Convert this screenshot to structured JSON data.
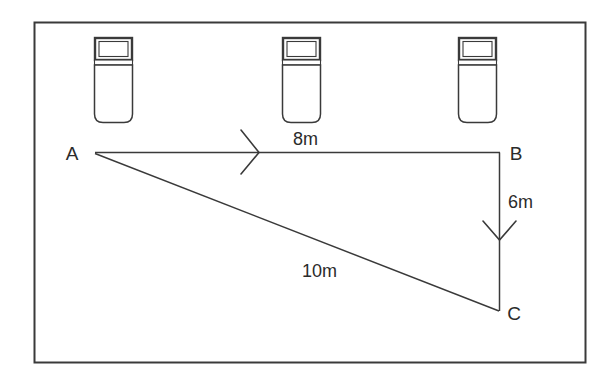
{
  "figure": {
    "background_color": "#ffffff",
    "stroke_color": "#2b2b2b",
    "border": {
      "name": "outer-frame",
      "x": 34,
      "y": 22,
      "width": 551,
      "height": 340
    }
  },
  "cars": [
    {
      "name": "car-left",
      "x": 94,
      "y": 37,
      "width": 39,
      "height": 86
    },
    {
      "name": "car-middle",
      "x": 282,
      "y": 37,
      "width": 39,
      "height": 86
    },
    {
      "name": "car-right",
      "x": 458,
      "y": 37,
      "width": 39,
      "height": 86
    }
  ],
  "points": [
    {
      "id": "A",
      "label": "A",
      "x": 95,
      "y": 153,
      "label_x": 72,
      "label_y": 159
    },
    {
      "id": "B",
      "label": "B",
      "x": 500,
      "y": 152,
      "label_x": 512,
      "label_y": 159
    },
    {
      "id": "C",
      "label": "C",
      "x": 498,
      "y": 310,
      "label_x": 510,
      "label_y": 320
    }
  ],
  "edges": [
    {
      "name": "edge-ab",
      "from": "A",
      "to": "B",
      "measure": "8m",
      "measure_x": 293,
      "measure_y": 143,
      "arrow_at_x": 252,
      "arrow_at_y": 152,
      "arrow_direction": "right"
    },
    {
      "name": "edge-bc",
      "from": "B",
      "to": "C",
      "measure": "6m",
      "measure_x": 508,
      "measure_y": 207,
      "arrow_at_x": 499,
      "arrow_at_y": 235,
      "arrow_direction": "down"
    },
    {
      "name": "edge-ac",
      "from": "A",
      "to": "C",
      "measure": "10m",
      "measure_x": 302,
      "measure_y": 276,
      "arrow_direction": "none"
    }
  ],
  "measures": {
    "ab": "8m",
    "bc": "6m",
    "ac": "10m"
  }
}
